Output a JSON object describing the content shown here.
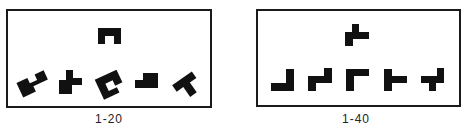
{
  "figure": {
    "panels": [
      {
        "id": "panel-a",
        "label": "1-20",
        "target": {
          "name": "target-shape",
          "description": "upside-down U block"
        },
        "options": [
          {
            "index": 1,
            "description": "rotated zigzag block"
          },
          {
            "index": 2,
            "description": "T-shaped block with stem down-left"
          },
          {
            "index": 3,
            "description": "rotated C block"
          },
          {
            "index": 4,
            "description": "L-shaped step block"
          },
          {
            "index": 5,
            "description": "rotated T block"
          }
        ]
      },
      {
        "id": "panel-b",
        "label": "1-40",
        "target": {
          "name": "target-shape",
          "description": "plus-like block with tail down"
        },
        "options": [
          {
            "index": 1,
            "description": "J / L block"
          },
          {
            "index": 2,
            "description": "step block"
          },
          {
            "index": 3,
            "description": "Γ block"
          },
          {
            "index": 4,
            "description": "⊢ block"
          },
          {
            "index": 5,
            "description": "cross-tail block"
          }
        ]
      }
    ],
    "colors": {
      "ink": "#111111",
      "frame": "#1a1a1a",
      "background": "#ffffff"
    }
  }
}
